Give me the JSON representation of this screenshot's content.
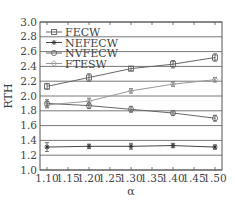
{
  "chart_data": {
    "type": "line",
    "title": "",
    "xlabel": "α",
    "ylabel": "RTH",
    "x": [
      1.1,
      1.2,
      1.3,
      1.4,
      1.5
    ],
    "xticks": [
      "1.10",
      "1.15",
      "1.20",
      "1.25",
      "1.30",
      "1.35",
      "1.40",
      "1.45",
      "1.50"
    ],
    "yticks": [
      "1.0",
      "1.2",
      "1.4",
      "1.6",
      "1.8",
      "2.0",
      "2.2",
      "2.4",
      "2.6",
      "2.8",
      "3.0"
    ],
    "xlim": [
      1.1,
      1.5
    ],
    "ylim": [
      1.0,
      3.0
    ],
    "grid": "horizontal",
    "legend_position": "upper left",
    "series": [
      {
        "name": "FECW",
        "marker": "square",
        "values": [
          2.13,
          2.25,
          2.37,
          2.43,
          2.52
        ],
        "err": [
          0.04,
          0.05,
          0.03,
          0.05,
          0.05
        ]
      },
      {
        "name": "NEFECW",
        "marker": "star",
        "values": [
          1.31,
          1.32,
          1.32,
          1.33,
          1.31
        ],
        "err": [
          0.06,
          0.03,
          0.04,
          0.03,
          0.03
        ]
      },
      {
        "name": "NVFECW",
        "marker": "circle",
        "values": [
          1.9,
          1.87,
          1.82,
          1.77,
          1.7
        ],
        "err": [
          0.05,
          0.04,
          0.04,
          0.03,
          0.04
        ]
      },
      {
        "name": "FTESW",
        "marker": "diamond",
        "values": [
          1.88,
          1.93,
          2.07,
          2.16,
          2.22
        ],
        "err": [
          0.04,
          0.04,
          0.03,
          0.03,
          0.03
        ]
      }
    ]
  }
}
